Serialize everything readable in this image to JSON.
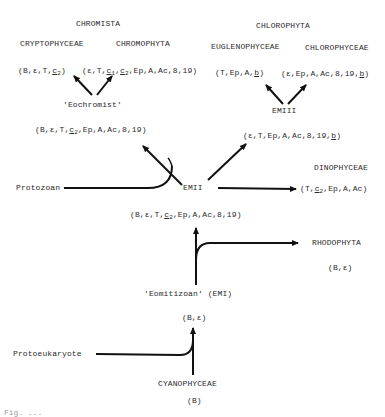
{
  "diagram": {
    "groups": {
      "chromista": "CHROMISTA",
      "chlorophyta": "CHLOROPHYTA"
    },
    "classes": {
      "cryptophyceae": "CRYPTOPHYCEAE",
      "chromophyta": "CHROMOPHYTA",
      "euglenophyceae": "EUGLENOPHYCEAE",
      "chlorophyceae": "CHLOROPHYCEAE",
      "dinophyceae": "DINOPHYCEAE",
      "rhodophyta": "RHODOPHYTA",
      "cyanophyceae": "CYANOPHYCEAE"
    },
    "pigment_sets": {
      "cryptophyceae": "(B,ε,T,c2)",
      "chromophyta": "(ε,T,c1,c2,Ep,A,Ac,8,19)",
      "euglenophyceae": "(T,Ep,A,b)",
      "chlorophyceae": "(ε,Ep,A,Ac,8,19,b)",
      "emii_left": "(B,ε,T,c2,Ep,A,Ac,8,19)",
      "emii_right": "(ε,T,Ep,A,Ac,8,19,b)",
      "dinophyceae": "(T,c2,Ep,A,Ac)",
      "emi_up": "(B,ε,T,c2,Ep,A,Ac,8,19)",
      "rhodophyta": "(B,ε)",
      "protoeukaryote_product": "(B,ε)",
      "cyanophyceae": "(B)"
    },
    "nodes": {
      "eochromist": "'Eochromist'",
      "emiii": "EMIII",
      "emii": "EMII",
      "protozoan": "Protozoan",
      "eomitizoan": "'Eomitizoan' (EMI)",
      "protoeukaryote": "Protoeukaryote"
    },
    "caption_partial": "Fig. ..."
  }
}
